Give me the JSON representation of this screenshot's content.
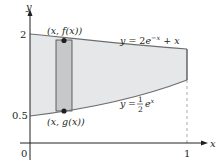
{
  "figure": {
    "axes": {
      "x_label": "x",
      "y_label": "y",
      "origin_label": "0",
      "x_tick_label": "1",
      "y_tick_labels": [
        "2",
        "0.5"
      ]
    },
    "curves": {
      "upper": {
        "label": "y = 2e^{-x} + x",
        "label_parts": [
          "y = 2e",
          "−x",
          " + x"
        ]
      },
      "lower": {
        "label": "y = (1/2)e^x",
        "label_parts": [
          "y = ",
          "1",
          "2",
          "e",
          "x"
        ]
      }
    },
    "points": {
      "top": "(x, f(x))",
      "bottom": "(x, g(x))"
    },
    "colors": {
      "region_fill": "#e6e7e8",
      "strip_fill": "#c7c8ca",
      "curve_stroke": "#6d6e71",
      "axis": "#231f20",
      "dashed": "#939598"
    }
  }
}
